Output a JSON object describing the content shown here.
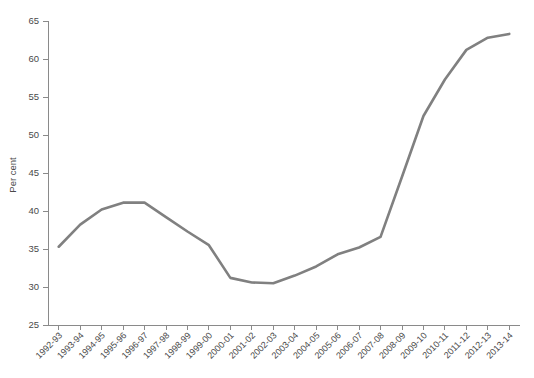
{
  "chart_data": {
    "type": "line",
    "title": "",
    "subtitle": "",
    "xlabel": "",
    "ylabel": "Per cent",
    "ylim": [
      25,
      65
    ],
    "ytick_step": 5,
    "yticks": [
      25,
      30,
      35,
      40,
      45,
      50,
      55,
      60,
      65
    ],
    "grid": false,
    "legend": false,
    "legend_position": "none",
    "line_color": "#808080",
    "categories": [
      "1992-93",
      "1993-94",
      "1994-95",
      "1995-96",
      "1996-97",
      "1997-98",
      "1998-99",
      "1999-00",
      "2000-01",
      "2001-02",
      "2002-03",
      "2003-04",
      "2004-05",
      "2005-06",
      "2006-07",
      "2007-08",
      "2008-09",
      "2009-10",
      "2010-11",
      "2011-12",
      "2012-13",
      "2013-14"
    ],
    "values": [
      35.3,
      38.2,
      40.2,
      41.1,
      41.1,
      39.2,
      37.3,
      35.5,
      31.2,
      30.6,
      30.5,
      31.5,
      32.7,
      34.3,
      35.2,
      36.6,
      44.5,
      52.5,
      57.3,
      61.2,
      62.8,
      63.3
    ],
    "series": [
      {
        "name": "Per cent",
        "color": "#808080",
        "values": [
          35.3,
          38.2,
          40.2,
          41.1,
          41.1,
          39.2,
          37.3,
          35.5,
          31.2,
          30.6,
          30.5,
          31.5,
          32.7,
          34.3,
          35.2,
          36.6,
          44.5,
          52.5,
          57.3,
          61.2,
          62.8,
          63.3
        ]
      }
    ]
  },
  "colors": {
    "line": "#808080",
    "axis": "#8a8a8a",
    "text": "#4a4a4a",
    "background": "#ffffff"
  }
}
